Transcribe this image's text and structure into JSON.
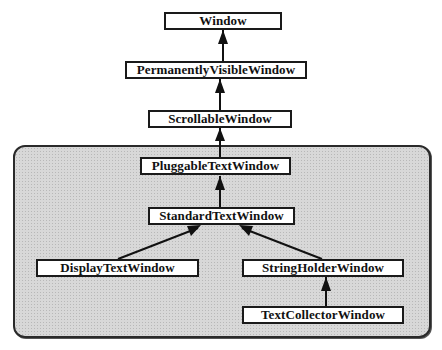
{
  "diagram": {
    "type": "class-hierarchy",
    "group": {
      "label": "text window subsystem (shaded)",
      "fill": "#d8d8d8",
      "border": "#2a2a2a"
    },
    "nodes": [
      {
        "id": "window",
        "label": "Window"
      },
      {
        "id": "permanently_visible_window",
        "label": "PermanentlyVisibleWindow"
      },
      {
        "id": "scrollable_window",
        "label": "ScrollableWindow"
      },
      {
        "id": "pluggable_text_window",
        "label": "PluggableTextWindow"
      },
      {
        "id": "standard_text_window",
        "label": "StandardTextWindow"
      },
      {
        "id": "display_text_window",
        "label": "DisplayTextWindow"
      },
      {
        "id": "string_holder_window",
        "label": "StringHolderWindow"
      },
      {
        "id": "text_collector_window",
        "label": "TextCollectorWindow"
      }
    ],
    "edges": [
      {
        "from": "PermanentlyVisibleWindow",
        "to": "Window",
        "kind": "inherits"
      },
      {
        "from": "ScrollableWindow",
        "to": "PermanentlyVisibleWindow",
        "kind": "inherits"
      },
      {
        "from": "PluggableTextWindow",
        "to": "ScrollableWindow",
        "kind": "inherits"
      },
      {
        "from": "StandardTextWindow",
        "to": "PluggableTextWindow",
        "kind": "inherits"
      },
      {
        "from": "DisplayTextWindow",
        "to": "StandardTextWindow",
        "kind": "inherits"
      },
      {
        "from": "StringHolderWindow",
        "to": "StandardTextWindow",
        "kind": "inherits"
      },
      {
        "from": "TextCollectorWindow",
        "to": "StringHolderWindow",
        "kind": "inherits"
      }
    ]
  }
}
